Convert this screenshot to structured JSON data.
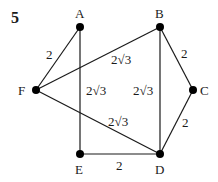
{
  "question_number": "5",
  "nodes": [
    {
      "id": "A",
      "label": "A",
      "x": 80,
      "y": 27
    },
    {
      "id": "B",
      "label": "B",
      "x": 160,
      "y": 27
    },
    {
      "id": "C",
      "label": "C",
      "x": 193,
      "y": 90
    },
    {
      "id": "D",
      "label": "D",
      "x": 160,
      "y": 154
    },
    {
      "id": "E",
      "label": "E",
      "x": 80,
      "y": 154
    },
    {
      "id": "F",
      "label": "F",
      "x": 36,
      "y": 90
    }
  ],
  "edges": [
    {
      "from": "F",
      "to": "A",
      "weight": "2"
    },
    {
      "from": "F",
      "to": "B",
      "weight": "2√3"
    },
    {
      "from": "A",
      "to": "E",
      "weight": "2√3"
    },
    {
      "from": "B",
      "to": "D",
      "weight": "2√3"
    },
    {
      "from": "B",
      "to": "C",
      "weight": "2"
    },
    {
      "from": "C",
      "to": "D",
      "weight": "2"
    },
    {
      "from": "F",
      "to": "D",
      "weight": "2√3"
    },
    {
      "from": "E",
      "to": "D",
      "weight": "2"
    }
  ],
  "labels": {
    "node_A": "A",
    "node_B": "B",
    "node_C": "C",
    "node_D": "D",
    "node_E": "E",
    "node_F": "F",
    "edge_FA": "2",
    "edge_FB": "2√3",
    "edge_AE": "2√3",
    "edge_BD": "2√3",
    "edge_BC": "2",
    "edge_CD": "2",
    "edge_FD": "2√3",
    "edge_ED": "2"
  }
}
